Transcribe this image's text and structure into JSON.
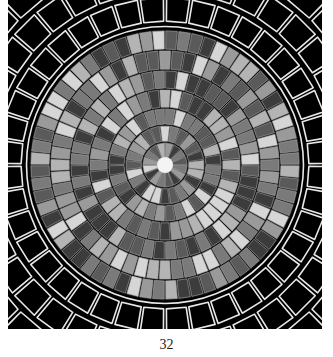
{
  "page": {
    "page_number": "32"
  },
  "figure": {
    "center": [
      157,
      165
    ],
    "colors": {
      "background": "#000000",
      "grout": "#111111",
      "outline": "#e8e8e8",
      "center": "#f4f4f4",
      "shades": [
        "#3c3c3c",
        "#5a5a5a",
        "#7a7a7a",
        "#9a9a9a",
        "#b4b4b4",
        "#d6d6d6"
      ]
    },
    "inner_rings": [
      {
        "r0": 7,
        "r1": 23,
        "count": 16
      },
      {
        "r0": 23,
        "r1": 40,
        "count": 24
      },
      {
        "r0": 40,
        "r1": 57,
        "count": 32
      },
      {
        "r0": 57,
        "r1": 76,
        "count": 40
      },
      {
        "r0": 76,
        "r1": 95,
        "count": 48
      },
      {
        "r0": 95,
        "r1": 115,
        "count": 56
      },
      {
        "r0": 115,
        "r1": 135,
        "count": 64
      }
    ],
    "divider_ring": {
      "r": 138.5,
      "width": 1.6
    },
    "outer_rings": [
      {
        "r0": 143,
        "r1": 168,
        "count": 40
      },
      {
        "r0": 173,
        "r1": 200,
        "count": 40
      },
      {
        "r0": 205,
        "r1": 236,
        "count": 40
      }
    ]
  }
}
